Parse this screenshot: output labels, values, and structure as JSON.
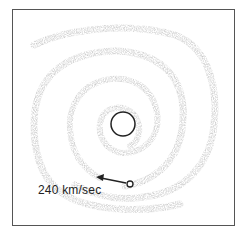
{
  "diagram": {
    "velocity_label": "240 km/sec",
    "colors": {
      "frame": "#555555",
      "arms": "#a8a8a8",
      "nucleus": "#222222",
      "arrow": "#222222",
      "background": "#ffffff"
    },
    "elements": {
      "nucleus": {
        "cx": 123,
        "cy": 124,
        "r": 12
      },
      "sun_marker": {
        "cx": 130,
        "cy": 184,
        "r": 3
      },
      "arrow": {
        "from": [
          126,
          183
        ],
        "to": [
          97,
          177
        ]
      }
    }
  }
}
